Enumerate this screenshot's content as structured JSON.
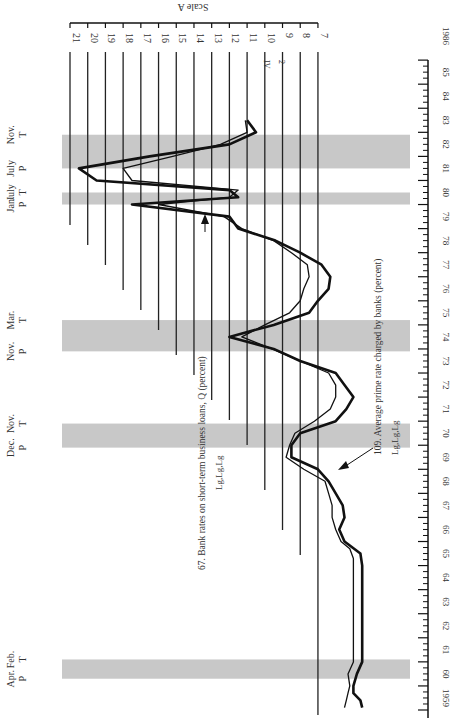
{
  "chart_data": {
    "type": "line",
    "orientation": "rotated-90-clockwise",
    "title": "",
    "xlabel": "Year",
    "ylabel": "Scale A",
    "ylim": [
      7,
      21
    ],
    "y_ticks": [
      21,
      20,
      19,
      18,
      17,
      16,
      15,
      14,
      13,
      12,
      11,
      10,
      9,
      8,
      7
    ],
    "x_range": [
      1959,
      1986
    ],
    "x_tick_labels": [
      "1959",
      "60",
      "61",
      "62",
      "63",
      "64",
      "65",
      "66",
      "67",
      "68",
      "69",
      "70",
      "71",
      "72",
      "73",
      "74",
      "75",
      "76",
      "77",
      "78",
      "79",
      "80",
      "81",
      "82",
      "83",
      "84",
      "85",
      "1986"
    ],
    "recessions": [
      {
        "peak_label": "P",
        "trough_label": "T",
        "peak_month": "Apr.",
        "trough_month": "Feb.",
        "start": 1960.3,
        "end": 1961.1
      },
      {
        "peak_label": "P",
        "trough_label": "T",
        "peak_month": "Dec.",
        "trough_month": "Nov.",
        "start": 1969.9,
        "end": 1970.9
      },
      {
        "peak_label": "P",
        "trough_label": "T",
        "peak_month": "Nov.",
        "trough_month": "Mar.",
        "start": 1973.9,
        "end": 1975.2
      },
      {
        "peak_label": "P",
        "trough_label": "T",
        "peak_month": "Jan.",
        "trough_month": "July",
        "start": 1980.0,
        "end": 1980.5
      },
      {
        "peak_label": "P",
        "trough_label": "T",
        "peak_month": "July",
        "trough_month": "Nov.",
        "start": 1981.5,
        "end": 1982.9
      }
    ],
    "series": [
      {
        "name": "67. Bank rates on short-term business loans, Q (percent)",
        "code": "Lg,Lg,Lg",
        "style": "thin",
        "x": [
          1959.1,
          1959.4,
          1959.7,
          1960.0,
          1960.5,
          1961.0,
          1962.0,
          1963.0,
          1964.0,
          1965.0,
          1965.3,
          1965.7,
          1966.0,
          1966.5,
          1967.0,
          1967.5,
          1968.0,
          1968.5,
          1969.0,
          1969.5,
          1970.0,
          1970.5,
          1971.0,
          1971.5,
          1972.0,
          1972.5,
          1973.0,
          1973.5,
          1974.0,
          1974.5,
          1975.0,
          1975.5,
          1976.0,
          1976.5,
          1977.0,
          1977.5,
          1978.0,
          1978.5,
          1979.0,
          1979.5,
          1980.0,
          1980.3,
          1980.6,
          1981.0,
          1981.5,
          1982.0,
          1982.5,
          1983.0,
          1983.5
        ],
        "values": [
          5.5,
          5.4,
          5.3,
          5.2,
          5.3,
          5.0,
          5.0,
          5.0,
          5.0,
          5.0,
          5.0,
          5.2,
          5.7,
          6.0,
          6.2,
          6.2,
          6.4,
          6.6,
          7.8,
          8.8,
          8.6,
          8.3,
          7.2,
          6.3,
          6.0,
          6.0,
          6.4,
          8.0,
          9.6,
          11.3,
          10.0,
          8.6,
          8.0,
          7.8,
          7.5,
          7.6,
          8.5,
          9.5,
          11.3,
          12.3,
          16.0,
          12.0,
          11.5,
          17.5,
          18.0,
          15.2,
          12.5,
          11.0,
          11.1
        ]
      },
      {
        "name": "109. Average prime rate charged by banks (percent)",
        "code": "Lg,Lg,Lg",
        "style": "thick",
        "x": [
          1959.1,
          1959.4,
          1959.7,
          1960.0,
          1960.5,
          1961.0,
          1962.0,
          1963.0,
          1964.0,
          1965.0,
          1965.5,
          1966.0,
          1966.5,
          1967.0,
          1967.5,
          1968.0,
          1968.5,
          1969.0,
          1969.5,
          1970.0,
          1970.5,
          1971.0,
          1971.5,
          1972.0,
          1972.5,
          1973.0,
          1973.5,
          1974.0,
          1974.5,
          1975.0,
          1975.5,
          1976.0,
          1976.5,
          1977.0,
          1977.5,
          1978.0,
          1978.5,
          1979.0,
          1979.5,
          1980.0,
          1980.3,
          1980.6,
          1981.0,
          1981.5,
          1982.0,
          1982.5,
          1983.0,
          1983.5
        ],
        "values": [
          4.5,
          4.6,
          5.0,
          5.0,
          4.8,
          4.5,
          4.5,
          4.5,
          4.5,
          4.5,
          4.6,
          5.5,
          5.8,
          5.5,
          5.6,
          6.0,
          6.4,
          7.0,
          8.5,
          8.5,
          8.0,
          6.0,
          5.4,
          5.0,
          5.5,
          6.0,
          8.0,
          9.5,
          12.0,
          9.5,
          7.5,
          7.0,
          6.4,
          6.3,
          6.8,
          8.0,
          9.4,
          11.5,
          12.0,
          17.5,
          11.5,
          12.0,
          19.5,
          20.5,
          16.5,
          12.0,
          10.5,
          11.0
        ]
      }
    ],
    "annotations": [
      {
        "text": "67. Bank rates on short-term business loans, Q (percent)",
        "arrow": true
      },
      {
        "text": "Lg,Lg,Lg",
        "near": "series-67"
      },
      {
        "text": "109. Average prime rate charged by banks (percent)",
        "arrow": true
      },
      {
        "text": "Lg,Lg,Lg",
        "near": "series-109"
      },
      {
        "text": "IV",
        "near": "gridline-11"
      },
      {
        "text": "2",
        "near": "gridline-11"
      }
    ],
    "grid": true,
    "legend": "inline annotations"
  },
  "labels": {
    "scale": "Scale A",
    "label67": "67. Bank rates on short-term business loans, Q (percent)",
    "code67": "Lg,Lg,Lg",
    "label109": "109. Average prime rate charged by banks (percent)",
    "code109": "Lg,Lg,Lg",
    "iv": "IV",
    "two": "2"
  }
}
